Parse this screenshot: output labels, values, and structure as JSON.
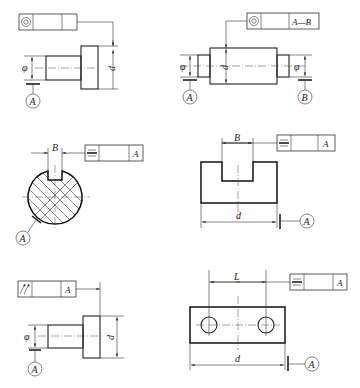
{
  "figures": [
    {
      "id": "concentricity-single",
      "frame": {
        "symbol": "concentricity",
        "tolerance": "",
        "datum": ""
      },
      "dims": {
        "small_dia": "φ",
        "large_dia": "d"
      },
      "datums": [
        "A"
      ]
    },
    {
      "id": "concentricity-common-axis",
      "frame": {
        "symbol": "concentricity",
        "tolerance": "",
        "datum": "A—B"
      },
      "dims": {
        "left_dia": "φ",
        "mid_dia": "d",
        "right_dia": "φ"
      },
      "datums": [
        "A",
        "B"
      ]
    },
    {
      "id": "symmetry-keyway-shaft",
      "frame": {
        "symbol": "symmetry",
        "tolerance": "",
        "datum": "A"
      },
      "dims": {
        "width": "B"
      },
      "datums": [
        "A"
      ]
    },
    {
      "id": "symmetry-slot-block",
      "frame": {
        "symbol": "symmetry",
        "tolerance": "",
        "datum": "A"
      },
      "dims": {
        "width": "B",
        "length": "d"
      },
      "datums": [
        "A"
      ]
    },
    {
      "id": "runout-shaft",
      "frame": {
        "symbol": "circular-runout",
        "tolerance": "",
        "datum": "A"
      },
      "dims": {
        "small_dia": "φ",
        "large_dia": "d"
      },
      "datums": [
        "A"
      ]
    },
    {
      "id": "symmetry-two-holes",
      "frame": {
        "symbol": "symmetry",
        "tolerance": "",
        "datum": "A"
      },
      "dims": {
        "spacing": "L",
        "length": "d"
      },
      "datums": [
        "A"
      ]
    }
  ]
}
